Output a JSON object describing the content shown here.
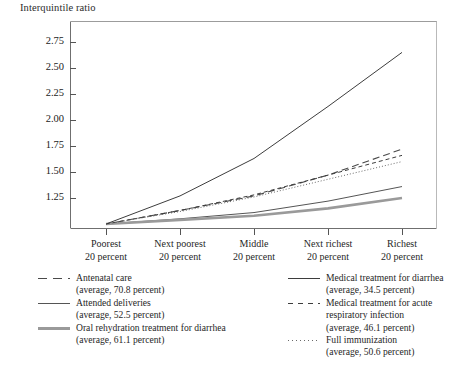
{
  "chart_data": {
    "type": "line",
    "title": "Interquintile ratio",
    "ylabel": "Interquintile ratio",
    "xlabel": "",
    "ylim": [
      0.95,
      2.92
    ],
    "yticks": [
      "1.25",
      "1.50",
      "1.75",
      "2.00",
      "2.25",
      "2.50",
      "2.75"
    ],
    "ytick_values": [
      1.25,
      1.5,
      1.75,
      2.0,
      2.25,
      2.5,
      2.75
    ],
    "grid": false,
    "legend_position": "below",
    "categories": [
      "Poorest 20 percent",
      "Next poorest 20 percent",
      "Middle 20 percent",
      "Next richest 20 percent",
      "Richest 20 percent"
    ],
    "series": [
      {
        "name": "Antenatal care",
        "average_label": "(average, 70.8 percent)",
        "average": 70.8,
        "style": "long-dash",
        "color": "#4a4a4a",
        "width": 1.1,
        "values": [
          1.0,
          1.13,
          1.27,
          1.47,
          1.72
        ]
      },
      {
        "name": "Attended deliveries",
        "average_label": "(average, 52.5 percent)",
        "average": 52.5,
        "style": "solid",
        "color": "#555555",
        "width": 1.0,
        "values": [
          1.0,
          1.05,
          1.11,
          1.22,
          1.36
        ]
      },
      {
        "name": "Oral rehydration treatment for diarrhea",
        "average_label": "(average, 61.1 percent)",
        "average": 61.1,
        "style": "solid-thick",
        "color": "#9a9a9a",
        "width": 2.6,
        "values": [
          1.0,
          1.04,
          1.08,
          1.15,
          1.25
        ]
      },
      {
        "name": "Medical treatment for diarrhea",
        "average_label": "(average, 34.5 percent)",
        "average": 34.5,
        "style": "solid",
        "color": "#3d3d3d",
        "width": 1.0,
        "values": [
          1.0,
          1.27,
          1.63,
          2.13,
          2.65
        ]
      },
      {
        "name": "Medical treatment for acute respiratory infection",
        "average_label": "(average, 46.1 percent)",
        "average": 46.1,
        "style": "short-dash",
        "color": "#3d3d3d",
        "width": 1.0,
        "values": [
          1.0,
          1.13,
          1.28,
          1.47,
          1.66
        ]
      },
      {
        "name": "Full immunization",
        "average_label": "(average, 50.6 percent)",
        "average": 50.6,
        "style": "dotted",
        "color": "#6a6a6a",
        "width": 1.0,
        "values": [
          1.0,
          1.12,
          1.26,
          1.43,
          1.6
        ]
      }
    ]
  },
  "axis": {
    "y_title": "Interquintile ratio",
    "x_labels": [
      {
        "line1": "Poorest",
        "line2": "20 percent"
      },
      {
        "line1": "Next poorest",
        "line2": "20 percent"
      },
      {
        "line1": "Middle",
        "line2": "20 percent"
      },
      {
        "line1": "Next richest",
        "line2": "20 percent"
      },
      {
        "line1": "Richest",
        "line2": "20 percent"
      }
    ],
    "y_labels": [
      "2.75",
      "2.50",
      "2.25",
      "2.00",
      "1.75",
      "1.50",
      "1.25"
    ]
  },
  "legend": {
    "left": [
      {
        "label": "Antenatal care",
        "avg": "(average, 70.8 percent)"
      },
      {
        "label": "Attended deliveries",
        "avg": "(average, 52.5 percent)"
      },
      {
        "label": "Oral rehydration treatment for diarrhea",
        "avg": "(average, 61.1 percent)"
      }
    ],
    "right": [
      {
        "label": "Medical treatment for diarrhea",
        "avg": "(average, 34.5 percent)"
      },
      {
        "label": "Medical treatment for acute respiratory infection",
        "avg": "(average, 46.1 percent)"
      },
      {
        "label": "Full immunization",
        "avg": "(average, 50.6 percent)"
      }
    ]
  }
}
